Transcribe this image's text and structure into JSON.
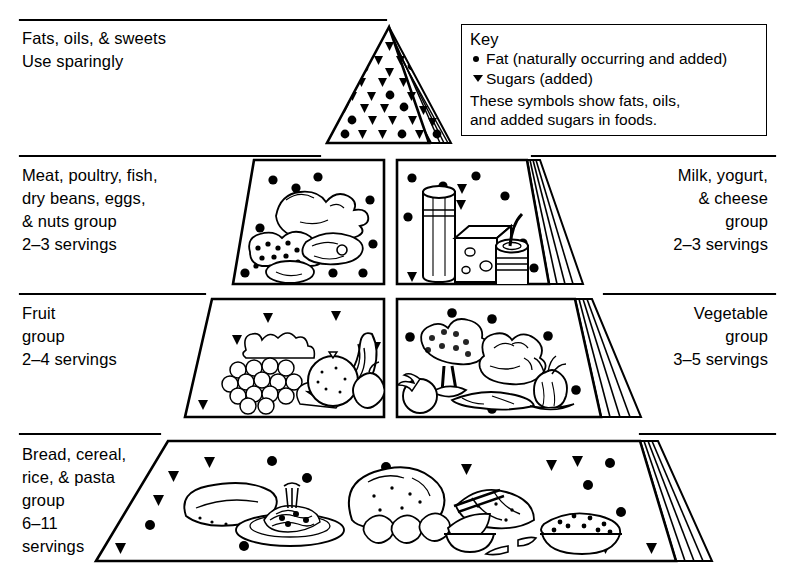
{
  "diagram": {
    "line_color": "#000000",
    "background": "#ffffff"
  },
  "key": {
    "title": "Key",
    "entries": [
      {
        "symbol": "fat-dot-icon",
        "glyph": "dot",
        "label": "Fat (naturally occurring and added)"
      },
      {
        "symbol": "sugar-triangle-icon",
        "glyph": "triangle",
        "label": "Sugars (added)"
      }
    ],
    "note": "These symbols show fats, oils,\nand added sugars in foods."
  },
  "tiers": [
    {
      "id": "fats-oils-sweets",
      "side": "left",
      "label": "Fats, oils, & sweets\nUse sparingly",
      "name": "Fats, oils, & sweets",
      "servings": "Use sparingly",
      "symbols": "sugars and fats"
    },
    {
      "id": "meat-group",
      "side": "left",
      "label": "Meat, poultry, fish,\ndry beans, eggs,\n& nuts group\n2–3 servings",
      "name": "Meat, poultry, fish, dry beans, eggs, & nuts group",
      "servings": "2–3 servings",
      "symbols": "fats"
    },
    {
      "id": "milk-group",
      "side": "right",
      "label": "Milk, yogurt,\n& cheese\ngroup\n2–3 servings",
      "name": "Milk, yogurt, & cheese group",
      "servings": "2–3 servings",
      "symbols": "fats and sugars"
    },
    {
      "id": "fruit-group",
      "side": "left",
      "label": "Fruit\ngroup\n2–4 servings",
      "name": "Fruit group",
      "servings": "2–4 servings",
      "symbols": "sugars"
    },
    {
      "id": "vegetable-group",
      "side": "right",
      "label": "Vegetable\ngroup\n3–5 servings",
      "name": "Vegetable group",
      "servings": "3–5 servings",
      "symbols": "fats"
    },
    {
      "id": "bread-group",
      "side": "left",
      "label": "Bread, cereal,\nrice, & pasta\ngroup\n6–11\nservings",
      "name": "Bread, cereal, rice, & pasta group",
      "servings": "6–11 servings",
      "symbols": "fats and sugars"
    }
  ],
  "illustrations": [
    {
      "panel": "meat-panel",
      "contents": "roast chicken, fish, beans, eggs, nuts"
    },
    {
      "panel": "milk-panel",
      "contents": "glass of milk, wedge of cheese, carton of yogurt"
    },
    {
      "panel": "fruit-panel",
      "contents": "grapes, bananas, orange, apple, strawberries"
    },
    {
      "panel": "vegetable-panel",
      "contents": "broccoli, cauliflower, tomato, carrot, onion"
    },
    {
      "panel": "bread-panel",
      "contents": "bread loaf, pasta plate, rolls, croissant, rice bowl, cereal bowl"
    }
  ]
}
